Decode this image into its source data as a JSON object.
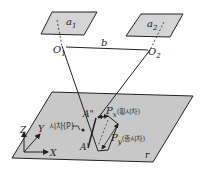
{
  "diagram": {
    "photos": [
      {
        "label": "a",
        "sub": "1",
        "center_label": "O",
        "center_sub": "1"
      },
      {
        "label": "a",
        "sub": "2",
        "center_label": "O",
        "center_sub": "2"
      }
    ],
    "baseline_label": "b",
    "ground_plane_label": "r",
    "axes": {
      "x": "X",
      "y": "Y",
      "z": "Z"
    },
    "points": {
      "a_double_prime": "A\"",
      "a_prime": "A'"
    },
    "parallax_label": "시차(P)",
    "px_label": "P",
    "px_sub": "x",
    "px_desc": "(횡시차)",
    "py_label": "P",
    "py_sub": "y",
    "py_desc": "(종시차)",
    "caption": ""
  },
  "colors": {
    "plane_fill": "#c8c8c8",
    "photo_fill": "#d4d4d4",
    "stroke": "#222222"
  }
}
